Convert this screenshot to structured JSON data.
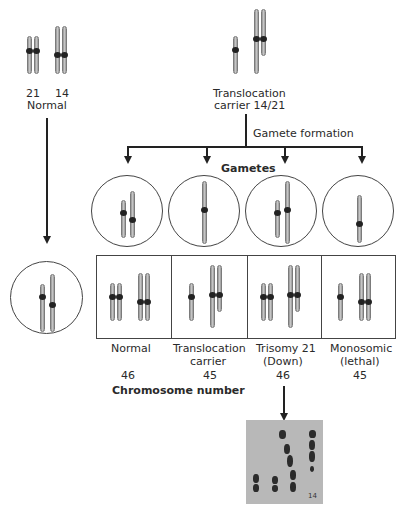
{
  "parents": {
    "normal": {
      "chrom21_label": "21",
      "chrom14_label": "14",
      "label": "Normal"
    },
    "carrier": {
      "label_line1": "Translocation",
      "label_line2": "carrier 14/21"
    }
  },
  "process": {
    "gamete_formation": "Gamete formation",
    "gametes_heading": "Gametes"
  },
  "zygotes": [
    {
      "label_line1": "Normal",
      "label_line2": "",
      "chromosome_number": "46"
    },
    {
      "label_line1": "Translocation",
      "label_line2": "carrier",
      "chromosome_number": "45"
    },
    {
      "label_line1": "Trisomy 21",
      "label_line2": "(Down)",
      "chromosome_number": "46"
    },
    {
      "label_line1": "Monosomic",
      "label_line2": "(lethal)",
      "chromosome_number": "45"
    }
  ],
  "chromosome_number_heading": "Chromosome number",
  "karyotype_photo": {
    "label": "14"
  },
  "colors": {
    "chromosome": "#b0b0b0",
    "centromere": "#222222",
    "lines": "#222222",
    "photo_bg": "#b8b8b8"
  }
}
